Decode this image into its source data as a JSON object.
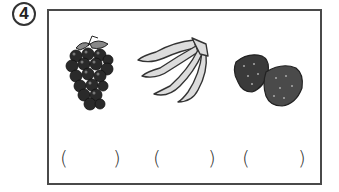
{
  "question": {
    "number": "4",
    "number_symbol": "④"
  },
  "items": [
    {
      "name": "grapes",
      "open": "(",
      "close": ")"
    },
    {
      "name": "bananas",
      "open": "(",
      "close": ")"
    },
    {
      "name": "strawberries",
      "open": "(",
      "close": ")"
    }
  ]
}
